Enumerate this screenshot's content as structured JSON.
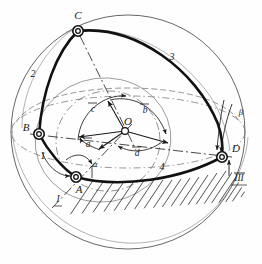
{
  "figure": {
    "type": "kinematic-mechanism-diagram",
    "background_color": "#fefefe",
    "ink_color": "#1a1a1a"
  },
  "nodes": [
    {
      "id": "C",
      "label": "C",
      "x": 78,
      "y": 31,
      "label_x": 78,
      "label_y": 16
    },
    {
      "id": "B",
      "label": "B",
      "x": 39,
      "y": 134,
      "label_x": 26,
      "label_y": 128
    },
    {
      "id": "A",
      "label": "A",
      "x": 76,
      "y": 177,
      "label_x": 79,
      "label_y": 190
    },
    {
      "id": "D",
      "label": "D",
      "x": 222,
      "y": 157,
      "label_x": 236,
      "label_y": 149
    },
    {
      "id": "O",
      "label": "O",
      "x": 125,
      "y": 131,
      "label_x": 126,
      "label_y": 124
    }
  ],
  "link_labels": [
    {
      "id": "link1",
      "label": "1",
      "x": 43,
      "y": 157
    },
    {
      "id": "link2",
      "label": "2",
      "x": 33,
      "y": 75
    },
    {
      "id": "link3",
      "label": "3",
      "x": 172,
      "y": 58
    },
    {
      "id": "link4",
      "label": "4",
      "x": 162,
      "y": 168
    }
  ],
  "vectors": [
    {
      "id": "a",
      "label": "a",
      "overbar": true,
      "x": 88,
      "y": 144
    },
    {
      "id": "b",
      "label": "b",
      "overbar": true,
      "x": 145,
      "y": 110
    },
    {
      "id": "c",
      "label": "c",
      "overbar": true,
      "x": 93,
      "y": 109
    },
    {
      "id": "d",
      "label": "d",
      "overbar": true,
      "x": 137,
      "y": 153
    }
  ],
  "angles": [
    {
      "id": "alpha",
      "label": "α",
      "x": 95,
      "y": 164
    },
    {
      "id": "beta",
      "label": "β",
      "x": 240,
      "y": 113
    }
  ],
  "axis_labels": [
    {
      "id": "axis-I",
      "label": "I",
      "x": 58,
      "y": 200
    },
    {
      "id": "axis-III",
      "label": "III",
      "x": 239,
      "y": 178
    }
  ],
  "geometry": {
    "sphere_center_x": 128,
    "sphere_center_y": 132,
    "sphere_radius": 117
  }
}
